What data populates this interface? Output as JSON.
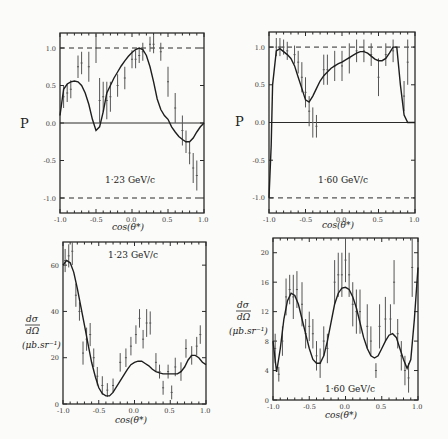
{
  "chart_data": [
    {
      "id": "p123",
      "type": "line",
      "title": "1.23 GeV/c",
      "annotation": "1·23 GeV/c",
      "xlabel": "cos(θ*)",
      "ylabel": "P",
      "xlim": [
        -1.0,
        1.0
      ],
      "ylim": [
        -1.2,
        1.2
      ],
      "xticks": [
        "-1.0",
        "-0.5",
        "0.0",
        "0.5",
        "1.0"
      ],
      "yticks": [
        "1.0",
        "0.5",
        "0.0",
        "-0.5",
        "-1.0"
      ],
      "reference_lines": [
        1.0,
        0.0,
        -1.0
      ],
      "frame": {
        "x0": 60,
        "x1": 204,
        "y0": 33,
        "y1": 213
      },
      "fit_curve": {
        "x": [
          -1.0,
          -0.95,
          -0.9,
          -0.85,
          -0.8,
          -0.75,
          -0.7,
          -0.65,
          -0.6,
          -0.55,
          -0.5,
          -0.45,
          -0.4,
          -0.35,
          -0.3,
          -0.25,
          -0.2,
          -0.15,
          -0.1,
          -0.05,
          0.0,
          0.05,
          0.1,
          0.15,
          0.2,
          0.25,
          0.3,
          0.35,
          0.4,
          0.45,
          0.5,
          0.55,
          0.6,
          0.65,
          0.7,
          0.75,
          0.8,
          0.85,
          0.9,
          0.95,
          1.0
        ],
        "y": [
          0.1,
          0.45,
          0.52,
          0.55,
          0.56,
          0.55,
          0.5,
          0.4,
          0.25,
          0.05,
          -0.1,
          -0.05,
          0.15,
          0.4,
          0.5,
          0.6,
          0.68,
          0.76,
          0.83,
          0.89,
          0.94,
          0.98,
          1.0,
          0.98,
          0.9,
          0.75,
          0.55,
          0.32,
          0.18,
          0.1,
          0.05,
          -0.05,
          -0.12,
          -0.18,
          -0.22,
          -0.25,
          -0.25,
          -0.2,
          -0.12,
          -0.05,
          0.0
        ]
      },
      "points": [
        {
          "x": -0.95,
          "y": 0.35,
          "e": 0.15
        },
        {
          "x": -0.9,
          "y": 0.4,
          "e": 0.12
        },
        {
          "x": -0.85,
          "y": 0.45,
          "e": 0.12
        },
        {
          "x": -0.75,
          "y": 0.75,
          "e": 0.15
        },
        {
          "x": -0.7,
          "y": 0.8,
          "e": 0.15
        },
        {
          "x": -0.6,
          "y": 0.75,
          "e": 0.2
        },
        {
          "x": -0.5,
          "y": 1.0,
          "e": 0.2
        },
        {
          "x": -0.45,
          "y": 0.3,
          "e": 0.3
        },
        {
          "x": -0.4,
          "y": 0.35,
          "e": 0.2
        },
        {
          "x": -0.35,
          "y": 0.3,
          "e": 0.25
        },
        {
          "x": -0.3,
          "y": 0.35,
          "e": 0.2
        },
        {
          "x": -0.2,
          "y": 0.5,
          "e": 0.15
        },
        {
          "x": -0.1,
          "y": 0.6,
          "e": 0.15
        },
        {
          "x": 0.0,
          "y": 0.85,
          "e": 0.12
        },
        {
          "x": 0.05,
          "y": 0.85,
          "e": 0.12
        },
        {
          "x": 0.1,
          "y": 0.9,
          "e": 0.1
        },
        {
          "x": 0.15,
          "y": 0.95,
          "e": 0.12
        },
        {
          "x": 0.25,
          "y": 1.05,
          "e": 0.1
        },
        {
          "x": 0.3,
          "y": 1.05,
          "e": 0.12
        },
        {
          "x": 0.4,
          "y": 0.95,
          "e": 0.12
        },
        {
          "x": 0.5,
          "y": 0.55,
          "e": 0.2
        },
        {
          "x": 0.6,
          "y": 0.2,
          "e": 0.2
        },
        {
          "x": 0.7,
          "y": -0.1,
          "e": 0.2
        },
        {
          "x": 0.75,
          "y": -0.25,
          "e": 0.15
        },
        {
          "x": 0.8,
          "y": -0.4,
          "e": 0.15
        },
        {
          "x": 0.85,
          "y": -0.6,
          "e": 0.2
        },
        {
          "x": 0.9,
          "y": -0.7,
          "e": 0.2
        }
      ]
    },
    {
      "id": "p160",
      "type": "line",
      "title": "1.60 GeV/c",
      "annotation": "1·60 GeV/c",
      "xlabel": "cos(θ*)",
      "ylabel": "P",
      "xlim": [
        -1.0,
        1.0
      ],
      "ylim": [
        -1.2,
        1.2
      ],
      "xticks": [
        "-1.0",
        "-0.5",
        "0.0",
        "0.5",
        "1.0"
      ],
      "yticks": [
        "1.0",
        "0.5",
        "0.0",
        "-0.5",
        "-1.0"
      ],
      "reference_lines": [
        1.0,
        0.0,
        -1.0
      ],
      "frame": {
        "x0": 269,
        "x1": 415,
        "y0": 32,
        "y1": 213
      },
      "fit_curve": {
        "x": [
          -1.0,
          -0.97,
          -0.95,
          -0.9,
          -0.85,
          -0.8,
          -0.75,
          -0.7,
          -0.65,
          -0.6,
          -0.55,
          -0.5,
          -0.45,
          -0.4,
          -0.35,
          -0.3,
          -0.25,
          -0.2,
          -0.15,
          -0.1,
          -0.05,
          0.0,
          0.05,
          0.1,
          0.15,
          0.2,
          0.25,
          0.3,
          0.35,
          0.4,
          0.45,
          0.5,
          0.55,
          0.6,
          0.65,
          0.7,
          0.75,
          0.8,
          0.85,
          0.9,
          0.95,
          1.0
        ],
        "y": [
          -1.0,
          -0.3,
          0.5,
          0.95,
          0.98,
          0.94,
          0.9,
          0.85,
          0.75,
          0.6,
          0.45,
          0.3,
          0.27,
          0.35,
          0.45,
          0.55,
          0.62,
          0.67,
          0.72,
          0.75,
          0.78,
          0.8,
          0.83,
          0.86,
          0.89,
          0.92,
          0.94,
          0.94,
          0.92,
          0.88,
          0.84,
          0.82,
          0.82,
          0.85,
          0.92,
          1.0,
          1.0,
          0.5,
          0.1,
          0.0,
          0.0,
          0.0
        ]
      },
      "points": [
        {
          "x": -0.9,
          "y": 1.0,
          "e": 0.12
        },
        {
          "x": -0.85,
          "y": 1.0,
          "e": 0.12
        },
        {
          "x": -0.8,
          "y": 1.0,
          "e": 0.1
        },
        {
          "x": -0.75,
          "y": 0.95,
          "e": 0.12
        },
        {
          "x": -0.65,
          "y": 0.9,
          "e": 0.12
        },
        {
          "x": -0.6,
          "y": 0.8,
          "e": 0.15
        },
        {
          "x": -0.55,
          "y": 0.6,
          "e": 0.2
        },
        {
          "x": -0.5,
          "y": 0.4,
          "e": 0.2
        },
        {
          "x": -0.45,
          "y": 0.15,
          "e": 0.2
        },
        {
          "x": -0.4,
          "y": 0.0,
          "e": 0.2
        },
        {
          "x": -0.35,
          "y": -0.05,
          "e": 0.15
        },
        {
          "x": -0.25,
          "y": 0.7,
          "e": 0.2
        },
        {
          "x": -0.2,
          "y": 0.7,
          "e": 0.2
        },
        {
          "x": -0.1,
          "y": 0.75,
          "e": 0.2
        },
        {
          "x": 0.0,
          "y": 0.75,
          "e": 0.2
        },
        {
          "x": 0.1,
          "y": 0.85,
          "e": 0.2
        },
        {
          "x": 0.2,
          "y": 0.95,
          "e": 0.15
        },
        {
          "x": 0.3,
          "y": 0.95,
          "e": 0.15
        },
        {
          "x": 0.4,
          "y": 0.9,
          "e": 0.15
        },
        {
          "x": 0.5,
          "y": 0.6,
          "e": 0.25
        },
        {
          "x": 0.6,
          "y": 0.9,
          "e": 0.15
        },
        {
          "x": 0.7,
          "y": 0.95,
          "e": 0.15
        },
        {
          "x": 0.85,
          "y": 0.35,
          "e": 0.2
        },
        {
          "x": 0.9,
          "y": 0.8,
          "e": 0.3
        }
      ]
    },
    {
      "id": "x123",
      "type": "line",
      "title": "1.23 GeV/c",
      "annotation": "1·23 GeV/c",
      "xlabel": "cos(θ*)",
      "ylabel": "dσ/dΩ (μb.sr⁻¹)",
      "xlim": [
        -1.0,
        1.0
      ],
      "ylim": [
        0,
        70
      ],
      "xticks": [
        "-1.0",
        "-0.5",
        "0.0",
        "0.5",
        "1.0"
      ],
      "yticks": [
        "60",
        "40",
        "20",
        "0"
      ],
      "frame": {
        "x0": 63,
        "x1": 206,
        "y0": 242,
        "y1": 404
      },
      "fit_curve": {
        "x": [
          -1.0,
          -0.95,
          -0.9,
          -0.85,
          -0.8,
          -0.75,
          -0.7,
          -0.65,
          -0.6,
          -0.55,
          -0.5,
          -0.45,
          -0.4,
          -0.35,
          -0.3,
          -0.25,
          -0.2,
          -0.15,
          -0.1,
          -0.05,
          0.0,
          0.05,
          0.1,
          0.15,
          0.2,
          0.25,
          0.3,
          0.35,
          0.4,
          0.45,
          0.5,
          0.55,
          0.6,
          0.65,
          0.7,
          0.75,
          0.8,
          0.85,
          0.9,
          0.95,
          1.0
        ],
        "y": [
          60,
          62,
          61,
          57,
          50,
          42,
          34,
          26,
          18,
          12,
          7,
          4.5,
          3.5,
          3.5,
          5,
          7.5,
          10,
          12.5,
          15,
          17,
          18,
          18.5,
          18.5,
          17.5,
          16.5,
          15,
          14,
          13.5,
          13,
          13,
          13,
          13,
          13,
          14,
          16,
          19,
          21,
          21,
          20,
          18,
          17
        ]
      },
      "points": [
        {
          "x": -0.97,
          "y": 62,
          "e": 5
        },
        {
          "x": -0.92,
          "y": 64,
          "e": 5
        },
        {
          "x": -0.87,
          "y": 66,
          "e": 6
        },
        {
          "x": -0.82,
          "y": 47,
          "e": 5
        },
        {
          "x": -0.77,
          "y": 40,
          "e": 4
        },
        {
          "x": -0.72,
          "y": 22,
          "e": 5
        },
        {
          "x": -0.67,
          "y": 28,
          "e": 5
        },
        {
          "x": -0.62,
          "y": 30,
          "e": 5
        },
        {
          "x": -0.57,
          "y": 20,
          "e": 4
        },
        {
          "x": -0.52,
          "y": 12,
          "e": 4
        },
        {
          "x": -0.45,
          "y": 8,
          "e": 4
        },
        {
          "x": -0.38,
          "y": 6,
          "e": 3
        },
        {
          "x": -0.3,
          "y": 8,
          "e": 3
        },
        {
          "x": -0.2,
          "y": 18,
          "e": 4
        },
        {
          "x": -0.12,
          "y": 20,
          "e": 4
        },
        {
          "x": -0.05,
          "y": 25,
          "e": 4
        },
        {
          "x": 0.02,
          "y": 30,
          "e": 4
        },
        {
          "x": 0.07,
          "y": 37,
          "e": 4
        },
        {
          "x": 0.12,
          "y": 28,
          "e": 4
        },
        {
          "x": 0.17,
          "y": 35,
          "e": 6
        },
        {
          "x": 0.22,
          "y": 35,
          "e": 5
        },
        {
          "x": 0.3,
          "y": 18,
          "e": 4
        },
        {
          "x": 0.35,
          "y": 14,
          "e": 3
        },
        {
          "x": 0.4,
          "y": 7,
          "e": 3
        },
        {
          "x": 0.47,
          "y": 14,
          "e": 3
        },
        {
          "x": 0.52,
          "y": 5,
          "e": 3
        },
        {
          "x": 0.57,
          "y": 16,
          "e": 4
        },
        {
          "x": 0.65,
          "y": 14,
          "e": 4
        },
        {
          "x": 0.72,
          "y": 24,
          "e": 4
        },
        {
          "x": 0.8,
          "y": 21,
          "e": 4
        },
        {
          "x": 0.87,
          "y": 25,
          "e": 4
        },
        {
          "x": 0.92,
          "y": 30,
          "e": 4
        }
      ]
    },
    {
      "id": "x160",
      "type": "line",
      "title": "1.60 GeV/c",
      "annotation": "1·60 GeV/c",
      "xlabel": "cos(θ*)",
      "ylabel": "dσ/dΩ (μb.sr⁻¹)",
      "xlim": [
        -1.0,
        1.0
      ],
      "ylim": [
        0,
        22
      ],
      "xticks": [
        "-1.0",
        "-0.5",
        "0.0",
        "0.5",
        "1.0"
      ],
      "yticks": [
        "20",
        "16",
        "12",
        "8",
        "4",
        "0"
      ],
      "frame": {
        "x0": 273,
        "x1": 418,
        "y0": 238,
        "y1": 400
      },
      "fit_curve": {
        "x": [
          -1.0,
          -0.95,
          -0.9,
          -0.85,
          -0.8,
          -0.75,
          -0.7,
          -0.65,
          -0.6,
          -0.55,
          -0.5,
          -0.45,
          -0.4,
          -0.35,
          -0.3,
          -0.25,
          -0.2,
          -0.15,
          -0.1,
          -0.05,
          0.0,
          0.05,
          0.1,
          0.15,
          0.2,
          0.25,
          0.3,
          0.35,
          0.4,
          0.45,
          0.5,
          0.55,
          0.6,
          0.65,
          0.7,
          0.75,
          0.8,
          0.85,
          0.9,
          0.95,
          1.0
        ],
        "y": [
          8,
          3.8,
          7,
          11,
          13.5,
          14.5,
          14.2,
          13,
          11,
          9,
          7,
          5.5,
          5,
          5,
          6,
          8,
          10.5,
          13,
          14.5,
          15.2,
          15.3,
          15,
          14,
          12.5,
          10.5,
          8.5,
          7,
          6,
          5.7,
          6,
          7,
          8,
          8.8,
          9,
          8.5,
          7,
          5.5,
          4.3,
          5.5,
          11,
          18
        ]
      },
      "points": [
        {
          "x": -0.97,
          "y": 7,
          "e": 2
        },
        {
          "x": -0.92,
          "y": 3.5,
          "e": 1
        },
        {
          "x": -0.87,
          "y": 8,
          "e": 2
        },
        {
          "x": -0.82,
          "y": 14,
          "e": 2.5
        },
        {
          "x": -0.77,
          "y": 15,
          "e": 2
        },
        {
          "x": -0.72,
          "y": 14,
          "e": 3
        },
        {
          "x": -0.67,
          "y": 15,
          "e": 2.5
        },
        {
          "x": -0.6,
          "y": 13,
          "e": 3
        },
        {
          "x": -0.55,
          "y": 9,
          "e": 2
        },
        {
          "x": -0.5,
          "y": 10,
          "e": 2
        },
        {
          "x": -0.45,
          "y": 9,
          "e": 2
        },
        {
          "x": -0.4,
          "y": 6,
          "e": 2
        },
        {
          "x": -0.35,
          "y": 5,
          "e": 2
        },
        {
          "x": -0.3,
          "y": 8,
          "e": 2
        },
        {
          "x": -0.25,
          "y": 7,
          "e": 2
        },
        {
          "x": -0.15,
          "y": 16,
          "e": 3
        },
        {
          "x": -0.1,
          "y": 17,
          "e": 3
        },
        {
          "x": -0.05,
          "y": 17,
          "e": 3
        },
        {
          "x": 0.0,
          "y": 19,
          "e": 3
        },
        {
          "x": 0.05,
          "y": 17,
          "e": 3
        },
        {
          "x": 0.1,
          "y": 13,
          "e": 3
        },
        {
          "x": 0.15,
          "y": 12,
          "e": 3
        },
        {
          "x": 0.2,
          "y": 12,
          "e": 3
        },
        {
          "x": 0.3,
          "y": 10,
          "e": 3
        },
        {
          "x": 0.35,
          "y": 8,
          "e": 2
        },
        {
          "x": 0.42,
          "y": 4,
          "e": 1
        },
        {
          "x": 0.47,
          "y": 10,
          "e": 3
        },
        {
          "x": 0.55,
          "y": 11,
          "e": 3
        },
        {
          "x": 0.62,
          "y": 11,
          "e": 2
        },
        {
          "x": 0.67,
          "y": 16,
          "e": 3
        },
        {
          "x": 0.72,
          "y": 9,
          "e": 2
        },
        {
          "x": 0.77,
          "y": 6,
          "e": 2
        },
        {
          "x": 0.82,
          "y": 4,
          "e": 2
        },
        {
          "x": 0.87,
          "y": 3,
          "e": 2
        },
        {
          "x": 0.92,
          "y": 18,
          "e": 4
        }
      ]
    }
  ],
  "labels": {
    "p_ylabel": "P",
    "ds_num": "dσ",
    "ds_den": "dΩ",
    "ds_units": "(μb.sr⁻¹)",
    "xlabel": "cos(θ*)"
  }
}
